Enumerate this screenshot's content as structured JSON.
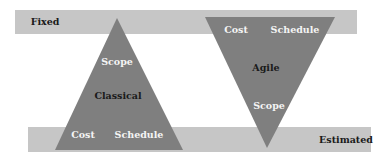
{
  "diagram": {
    "colors": {
      "bar": "#c6c6c6",
      "triangle": "#7f7f7f",
      "dark_text": "#1a1a1a",
      "light_text": "#f4f4f4"
    },
    "bars": {
      "top": {
        "label": "Fixed"
      },
      "bottom": {
        "label": "Estimated"
      }
    },
    "classical": {
      "name": "Classical",
      "orientation": "upright",
      "apex_label": "Scope",
      "base_labels": [
        "Cost",
        "Schedule"
      ]
    },
    "agile": {
      "name": "Agile",
      "orientation": "inverted",
      "apex_label": "Scope",
      "base_labels": [
        "Cost",
        "Schedule"
      ]
    }
  }
}
